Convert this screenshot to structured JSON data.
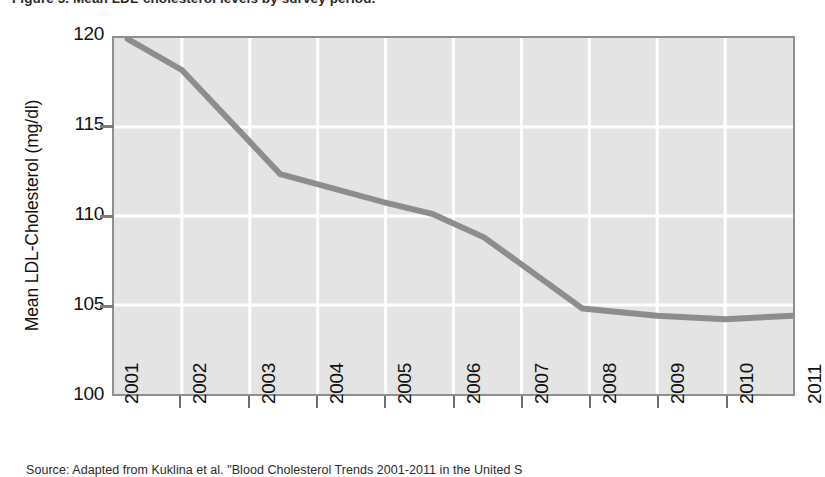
{
  "figure": {
    "top_clipped_text": "Figure 3. Mean LDL-cholesterol levels by survey period.",
    "source_note": "Source: Adapted from Kuklina et al. \"Blood Cholesterol Trends 2001-2011 in the United S"
  },
  "axes": {
    "y_title": "Mean LDL-Cholesterol (mg/dl)",
    "y_tick_labels": [
      "120",
      "115",
      "110",
      "105",
      "100"
    ],
    "x_tick_labels": [
      "2001",
      "2002",
      "2003",
      "2004",
      "2005",
      "2006",
      "2007",
      "2008",
      "2009",
      "2010",
      "2011"
    ]
  },
  "colors": {
    "plot_background": "#e4e4e4",
    "gridline": "#ffffff",
    "line": "#8d8d8d",
    "axis": "#8f8f8f",
    "text": "#111111"
  },
  "chart_data": {
    "type": "line",
    "title": "",
    "xlabel": "",
    "ylabel": "Mean LDL-Cholesterol (mg/dl)",
    "xlim": [
      2001,
      2011
    ],
    "ylim": [
      100,
      120
    ],
    "yticks": [
      100,
      105,
      110,
      115,
      120
    ],
    "xticks": [
      2001,
      2002,
      2003,
      2004,
      2005,
      2006,
      2007,
      2008,
      2009,
      2010,
      2011
    ],
    "grid": true,
    "legend": false,
    "series": [
      {
        "name": "Mean LDL-Cholesterol",
        "color": "#8d8d8d",
        "x": [
          2001.2,
          2002.0,
          2003.45,
          2004.95,
          2005.7,
          2006.45,
          2007.9,
          2009.0,
          2010.0
        ],
        "y": [
          119.95,
          118.2,
          112.35,
          110.8,
          110.1,
          108.8,
          104.8,
          104.4,
          104.2
        ],
        "points": [
          {
            "x": 2001.2,
            "y": 119.95
          },
          {
            "x": 2002.0,
            "y": 118.2
          },
          {
            "x": 2003.45,
            "y": 112.35
          },
          {
            "x": 2004.95,
            "y": 110.8
          },
          {
            "x": 2005.7,
            "y": 110.1
          },
          {
            "x": 2006.45,
            "y": 108.8
          },
          {
            "x": 2007.9,
            "y": 104.8
          },
          {
            "x": 2009.0,
            "y": 104.4
          },
          {
            "x": 2010.0,
            "y": 104.2
          },
          {
            "x": 2011.0,
            "y": 104.4
          }
        ]
      }
    ]
  }
}
